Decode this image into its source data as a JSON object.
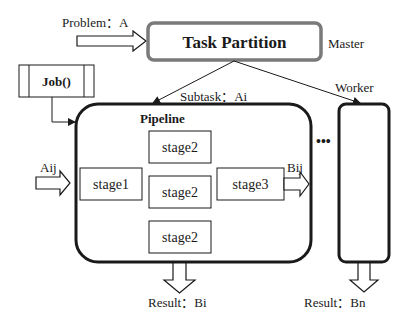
{
  "colors": {
    "stroke": "#1a1a1a",
    "master_border": "#7a7a7a",
    "text": "#1a1a1a",
    "background": "#ffffff"
  },
  "master": {
    "title": "Task Partition",
    "role_label": "Master",
    "input_label": "Problem：A"
  },
  "job": {
    "label": "Job()"
  },
  "pipeline": {
    "title": "Pipeline",
    "subtask_label": "Subtask：Ai",
    "input_label": "Aij",
    "output_label": "Bij",
    "result_label": "Result：Bi",
    "stages": [
      {
        "label": "stage2"
      },
      {
        "label": "stage1"
      },
      {
        "label": "stage2"
      },
      {
        "label": "stage3"
      },
      {
        "label": "stage2"
      }
    ]
  },
  "worker": {
    "role_label": "Worker",
    "result_label": "Result：Bn"
  },
  "ellipsis": "•••"
}
